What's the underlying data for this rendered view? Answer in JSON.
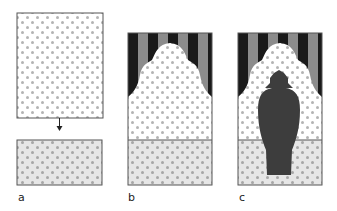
{
  "figure": {
    "panels": [
      {
        "id": "a",
        "label": "a",
        "description": "Dotted wall rectangle with arrow down to dotted floor rectangle"
      },
      {
        "id": "b",
        "label": "b",
        "description": "Curtain-shaped striped background over dotted wall and dotted floor"
      },
      {
        "id": "c",
        "label": "c",
        "description": "Same scene as b with a dark vase silhouette"
      }
    ]
  },
  "colors": {
    "outline": "#555555",
    "dot": "#b3b3b3",
    "wall": "#ffffff",
    "floor": "#e6e6e6",
    "stripe_dark": "#1a1a1a",
    "stripe_light": "#8c8c8c",
    "vase": "#3d3d3d"
  }
}
